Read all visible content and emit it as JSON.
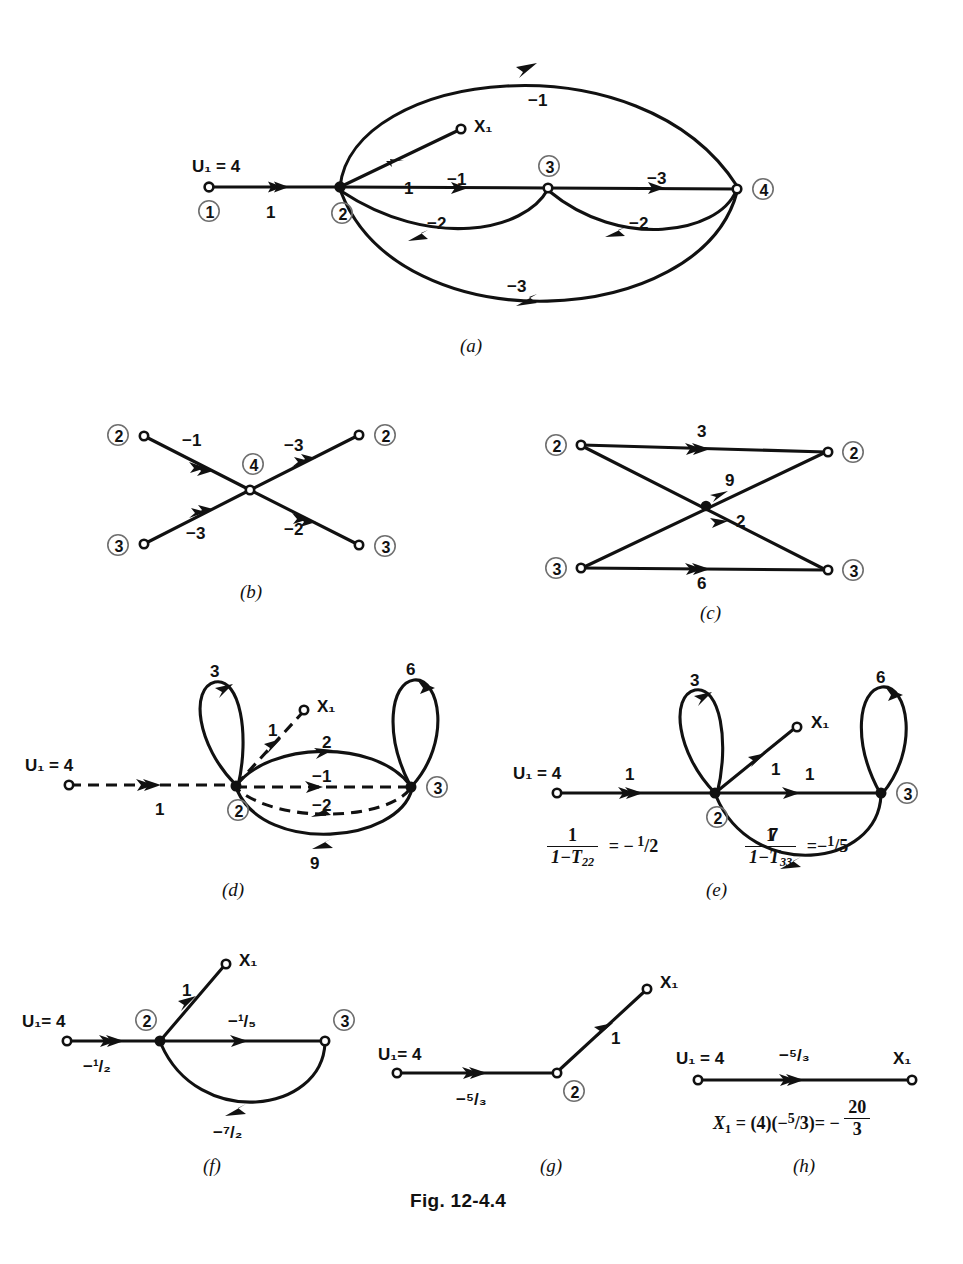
{
  "figure": {
    "caption": "Fig. 12-4.4",
    "panels": [
      "(a)",
      "(b)",
      "(c)",
      "(d)",
      "(e)",
      "(f)",
      "(g)",
      "(h)"
    ]
  },
  "panel_a": {
    "label": "(a)",
    "source_label": "U₁ = 4",
    "output_label": "X₁",
    "nodes": [
      "1",
      "2",
      "3",
      "4"
    ],
    "edges": [
      {
        "from": "1",
        "to": "2",
        "gain": "1"
      },
      {
        "from": "2",
        "to": "X1",
        "gain": "1"
      },
      {
        "from": "2",
        "to": "4",
        "gain": "−1",
        "path": "upper-arc"
      },
      {
        "from": "2",
        "to": "3",
        "gain": "−1"
      },
      {
        "from": "3",
        "to": "2",
        "gain": "−2"
      },
      {
        "from": "3",
        "to": "4",
        "gain": "−3"
      },
      {
        "from": "4",
        "to": "3",
        "gain": "−2"
      },
      {
        "from": "4",
        "to": "2",
        "gain": "−3",
        "path": "lower-arc"
      }
    ]
  },
  "panel_b": {
    "label": "(b)",
    "center_node": "4",
    "left_nodes": [
      "2",
      "3"
    ],
    "right_nodes": [
      "2",
      "3"
    ],
    "edges": [
      {
        "from": "2",
        "to": "4",
        "gain": "−1"
      },
      {
        "from": "3",
        "to": "4",
        "gain": "−3"
      },
      {
        "from": "4",
        "to": "2",
        "gain": "−3"
      },
      {
        "from": "4",
        "to": "3",
        "gain": "−2"
      }
    ]
  },
  "panel_c": {
    "label": "(c)",
    "left_nodes": [
      "2",
      "3"
    ],
    "right_nodes": [
      "2",
      "3"
    ],
    "edges": [
      {
        "from": "2",
        "to": "2",
        "gain": "3"
      },
      {
        "from": "2",
        "to": "3",
        "gain": "2"
      },
      {
        "from": "3",
        "to": "2",
        "gain": "9"
      },
      {
        "from": "3",
        "to": "3",
        "gain": "6"
      }
    ]
  },
  "panel_d": {
    "label": "(d)",
    "source_label": "U₁ = 4",
    "output_label": "X₁",
    "nodes": [
      "2",
      "3"
    ],
    "loops": [
      {
        "at": "2",
        "gain": "3"
      },
      {
        "at": "3",
        "gain": "6"
      }
    ],
    "edges": [
      {
        "from": "U1",
        "to": "2",
        "gain": "1",
        "style": "dashed"
      },
      {
        "from": "2",
        "to": "X1",
        "gain": "1",
        "style": "dashed"
      },
      {
        "from": "2",
        "to": "3",
        "gain": "2",
        "style": "solid"
      },
      {
        "from": "2",
        "to": "3",
        "gain": "−1",
        "style": "dashed"
      },
      {
        "from": "3",
        "to": "2",
        "gain": "−2",
        "style": "dashed"
      },
      {
        "from": "3",
        "to": "2",
        "gain": "9",
        "style": "solid"
      }
    ]
  },
  "panel_e": {
    "label": "(e)",
    "source_label": "U₁ = 4",
    "output_label": "X₁",
    "nodes": [
      "2",
      "3"
    ],
    "loops": [
      {
        "at": "2",
        "gain": "3"
      },
      {
        "at": "3",
        "gain": "6"
      }
    ],
    "edges": [
      {
        "from": "U1",
        "to": "2",
        "gain": "1"
      },
      {
        "from": "2",
        "to": "X1",
        "gain": "1"
      },
      {
        "from": "2",
        "to": "3",
        "gain": "1"
      },
      {
        "from": "3",
        "to": "2",
        "gain": "7"
      }
    ],
    "formula_left": {
      "numerator": "1",
      "denominator": "1 − T₂₂",
      "equals": "− ¹/₂"
    },
    "formula_right": {
      "numerator": "1",
      "denominator": "1 − T₃₃",
      "equals": "−¹/₅"
    }
  },
  "panel_f": {
    "label": "(f)",
    "source_label": "U₁= 4",
    "output_label": "X₁",
    "nodes": [
      "2",
      "3"
    ],
    "edges": [
      {
        "from": "U1",
        "to": "2",
        "gain": "−¹/₂"
      },
      {
        "from": "2",
        "to": "X1",
        "gain": "1"
      },
      {
        "from": "2",
        "to": "3",
        "gain": "−¹/₅"
      },
      {
        "from": "3",
        "to": "2",
        "gain": "−⁷/₂"
      }
    ]
  },
  "panel_g": {
    "label": "(g)",
    "source_label": "U₁= 4",
    "output_label": "X₁",
    "nodes": [
      "2"
    ],
    "edges": [
      {
        "from": "U1",
        "to": "2",
        "gain": "−⁵/₃"
      },
      {
        "from": "2",
        "to": "X1",
        "gain": "1"
      }
    ]
  },
  "panel_h": {
    "label": "(h)",
    "source_label": "U₁ = 4",
    "output_label": "X₁",
    "edges": [
      {
        "from": "U1",
        "to": "X1",
        "gain": "−⁵/₃"
      }
    ],
    "result": "X₁ = (4)(−⁵/₃)= −20/3"
  }
}
